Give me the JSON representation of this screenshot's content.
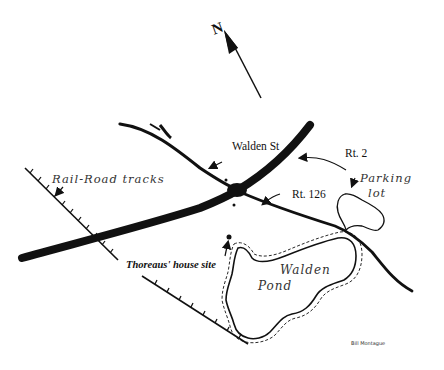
{
  "map": {
    "compass": {
      "label": "N",
      "icon": "north-arrow-icon"
    },
    "roads": {
      "walden_st": {
        "label": "Walden St"
      },
      "rt2": {
        "label": "Rt. 2"
      },
      "rt126": {
        "label": "Rt. 126"
      }
    },
    "railroad": {
      "label": "Rail-Road tracks"
    },
    "landmarks": {
      "parking_line1": "Parking",
      "parking_line2": "lot",
      "thoreau_house": "Thoreaus' house site",
      "pond_line1": "Walden",
      "pond_line2": "Pond"
    },
    "signature": "Bill Montague",
    "colors": {
      "ink": "#111111",
      "background": "#ffffff"
    }
  }
}
